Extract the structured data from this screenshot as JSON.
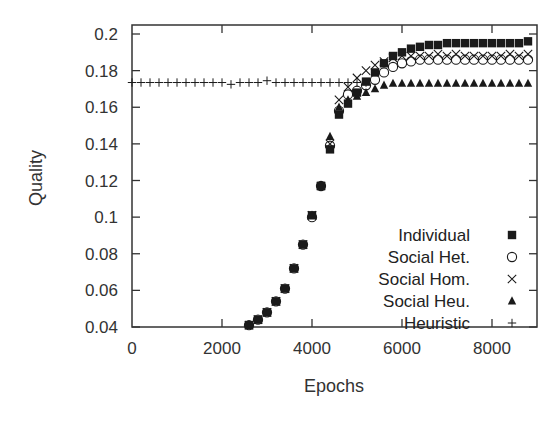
{
  "chart_data": {
    "type": "scatter",
    "title": "",
    "xlabel": "Epochs",
    "ylabel": "Quality",
    "xlim": [
      0,
      9000
    ],
    "ylim": [
      0.04,
      0.205
    ],
    "xticks": [
      0,
      2000,
      4000,
      6000,
      8000
    ],
    "yticks": [
      0.04,
      0.06,
      0.08,
      0.1,
      0.12,
      0.14,
      0.16,
      0.18,
      0.2
    ],
    "xtick_labels": [
      "0",
      "2000",
      "4000",
      "6000",
      "8000"
    ],
    "ytick_labels": [
      "0.04",
      "0.06",
      "0.08",
      "0.1",
      "0.12",
      "0.14",
      "0.16",
      "0.18",
      "0.2"
    ],
    "grid": false,
    "legend_position": "lower right",
    "x": [
      2600,
      2800,
      3000,
      3200,
      3400,
      3600,
      3800,
      4000,
      4200,
      4400,
      4600,
      4800,
      5000,
      5200,
      5400,
      5600,
      5800,
      6000,
      6200,
      6400,
      6600,
      6800,
      7000,
      7200,
      7400,
      7600,
      7800,
      8000,
      8200,
      8400,
      8600,
      8800
    ],
    "series": [
      {
        "name": "Individual",
        "marker": "filled-square",
        "values": [
          0.041,
          0.044,
          0.048,
          0.054,
          0.061,
          0.072,
          0.085,
          0.101,
          0.117,
          0.137,
          0.156,
          0.162,
          0.168,
          0.174,
          0.179,
          0.184,
          0.188,
          0.19,
          0.192,
          0.193,
          0.194,
          0.194,
          0.195,
          0.195,
          0.195,
          0.195,
          0.195,
          0.195,
          0.195,
          0.195,
          0.195,
          0.196
        ]
      },
      {
        "name": "Social Het.",
        "marker": "open-circle",
        "values": [
          0.041,
          0.044,
          0.048,
          0.054,
          0.061,
          0.072,
          0.085,
          0.1,
          0.117,
          0.139,
          0.158,
          0.167,
          0.169,
          0.172,
          0.175,
          0.179,
          0.182,
          0.184,
          0.185,
          0.186,
          0.186,
          0.186,
          0.186,
          0.186,
          0.186,
          0.186,
          0.186,
          0.186,
          0.186,
          0.186,
          0.186,
          0.186
        ]
      },
      {
        "name": "Social Hom.",
        "marker": "cross-x",
        "values": [
          0.041,
          0.044,
          0.048,
          0.054,
          0.061,
          0.072,
          0.085,
          0.101,
          0.117,
          0.14,
          0.164,
          0.171,
          0.176,
          0.18,
          0.183,
          0.185,
          0.187,
          0.188,
          0.188,
          0.188,
          0.188,
          0.189,
          0.188,
          0.189,
          0.188,
          0.188,
          0.188,
          0.188,
          0.188,
          0.189,
          0.188,
          0.189
        ]
      },
      {
        "name": "Social Heu.",
        "marker": "filled-triangle",
        "values": [
          0.041,
          0.044,
          0.048,
          0.054,
          0.061,
          0.072,
          0.085,
          0.101,
          0.117,
          0.144,
          0.16,
          0.164,
          0.166,
          0.168,
          0.17,
          0.172,
          0.173,
          0.173,
          0.173,
          0.173,
          0.173,
          0.173,
          0.173,
          0.173,
          0.173,
          0.173,
          0.173,
          0.173,
          0.173,
          0.173,
          0.173,
          0.173
        ]
      },
      {
        "name": "Heuristic",
        "marker": "plus",
        "x": [
          0,
          200,
          400,
          600,
          800,
          1000,
          1200,
          1400,
          1600,
          1800,
          2000,
          2200,
          2400,
          2600,
          2800,
          3000,
          3200,
          3400,
          3600,
          3800,
          4000,
          4200,
          4400,
          4600,
          4800,
          5000,
          5200
        ],
        "values": [
          0.1735,
          0.1735,
          0.1735,
          0.1735,
          0.1735,
          0.1735,
          0.1735,
          0.1735,
          0.1735,
          0.1735,
          0.1735,
          0.1725,
          0.1735,
          0.1735,
          0.1735,
          0.1745,
          0.1735,
          0.1735,
          0.1735,
          0.1735,
          0.1735,
          0.1735,
          0.1735,
          0.1735,
          0.1735,
          0.1735,
          0.1735
        ]
      }
    ]
  },
  "legend": {
    "items": [
      {
        "label": "Individual",
        "marker": "filled-square"
      },
      {
        "label": "Social Het.",
        "marker": "open-circle"
      },
      {
        "label": "Social Hom.",
        "marker": "cross-x"
      },
      {
        "label": "Social Heu.",
        "marker": "filled-triangle"
      },
      {
        "label": "Heuristic",
        "marker": "plus"
      }
    ]
  },
  "colors": {
    "axis": "#333333",
    "marker": "#1a1a1a",
    "background": "#ffffff"
  }
}
